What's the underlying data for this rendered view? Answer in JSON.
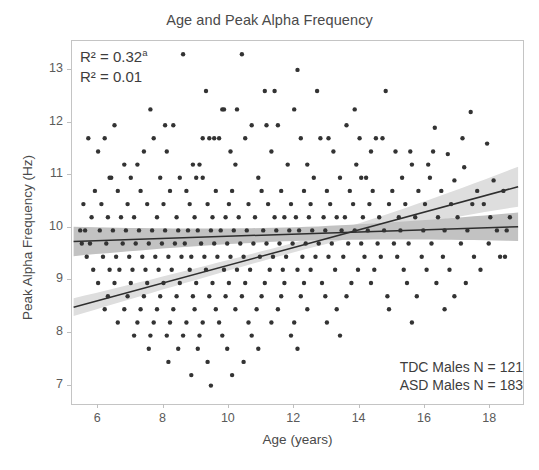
{
  "chart_data": {
    "type": "scatter",
    "title": "Age and Peak Alpha Frequency",
    "xlabel": "Age (years)",
    "ylabel": "Peak Alpha Frequency (Hz)",
    "xlim": [
      5.2,
      19.0
    ],
    "ylim": [
      6.65,
      13.55
    ],
    "xticks": [
      6,
      8,
      10,
      12,
      14,
      16,
      18
    ],
    "yticks": [
      7,
      8,
      9,
      10,
      11,
      12,
      13
    ],
    "grid": false,
    "legend_position": "bottom-right",
    "annotations": [
      {
        "name": "r2-tdc",
        "text": "R² = 0.32",
        "superscript": "a"
      },
      {
        "name": "r2-asd",
        "text": "R² = 0.01",
        "superscript": ""
      }
    ],
    "legend": [
      {
        "name": "tdc-males",
        "label": "TDC Males N = 121",
        "n": 121
      },
      {
        "name": "asd-males",
        "label": "ASD Males N = 183",
        "n": 183
      }
    ],
    "point_color": "#333333",
    "point_radius": 2.2,
    "series": [
      {
        "name": "TDC Males",
        "group": "TDC",
        "n": 121,
        "r_squared": 0.32,
        "fit": {
          "type": "linear",
          "x_start": 5.25,
          "x_end": 18.85,
          "y_start": 9.74,
          "y_end": 10.02,
          "band_color": "#c2c2c2",
          "line_color": "#2e2e2e",
          "band_half_width_start": 0.28,
          "band_half_width_mid": 0.13,
          "band_half_width_end": 0.27
        }
      },
      {
        "name": "ASD Males",
        "group": "ASD",
        "n": 183,
        "r_squared": 0.01,
        "fit": {
          "type": "linear",
          "x_start": 5.25,
          "x_end": 18.85,
          "y_start": 8.49,
          "y_end": 10.78,
          "band_color": "#dedede",
          "line_color": "#2e2e2e",
          "band_half_width_start": 0.17,
          "band_half_width_mid": 0.09,
          "band_half_width_end": 0.38
        }
      }
    ],
    "points": [
      [
        8.6,
        13.3
      ],
      [
        10.4,
        13.3
      ],
      [
        12.1,
        13.0
      ],
      [
        9.3,
        12.6
      ],
      [
        11.1,
        12.6
      ],
      [
        14.8,
        12.6
      ],
      [
        7.6,
        12.25
      ],
      [
        9.8,
        12.25
      ],
      [
        9.85,
        12.25
      ],
      [
        12.0,
        12.25
      ],
      [
        17.4,
        12.2
      ],
      [
        6.5,
        11.95
      ],
      [
        8.3,
        11.95
      ],
      [
        10.7,
        11.95
      ],
      [
        11.5,
        11.95
      ],
      [
        13.6,
        11.95
      ],
      [
        16.3,
        11.9
      ],
      [
        5.7,
        11.7
      ],
      [
        6.2,
        11.7
      ],
      [
        7.7,
        11.7
      ],
      [
        9.2,
        11.7
      ],
      [
        9.4,
        11.7
      ],
      [
        9.55,
        11.7
      ],
      [
        9.7,
        11.7
      ],
      [
        10.5,
        11.7
      ],
      [
        12.2,
        11.7
      ],
      [
        12.8,
        11.7
      ],
      [
        14.0,
        11.7
      ],
      [
        14.5,
        11.7
      ],
      [
        14.7,
        11.7
      ],
      [
        17.9,
        11.6
      ],
      [
        6.0,
        11.45
      ],
      [
        7.4,
        11.45
      ],
      [
        8.1,
        11.45
      ],
      [
        11.3,
        11.45
      ],
      [
        13.2,
        11.45
      ],
      [
        15.1,
        11.45
      ],
      [
        16.7,
        11.4
      ],
      [
        6.8,
        11.2
      ],
      [
        7.2,
        11.2
      ],
      [
        8.9,
        11.2
      ],
      [
        9.1,
        11.2
      ],
      [
        10.2,
        11.2
      ],
      [
        11.8,
        11.2
      ],
      [
        12.4,
        11.2
      ],
      [
        13.9,
        11.2
      ],
      [
        15.6,
        11.2
      ],
      [
        16.1,
        11.2
      ],
      [
        17.2,
        11.15
      ],
      [
        6.4,
        10.95
      ],
      [
        7.0,
        10.95
      ],
      [
        8.5,
        10.95
      ],
      [
        9.0,
        10.95
      ],
      [
        10.9,
        10.95
      ],
      [
        12.6,
        10.95
      ],
      [
        13.4,
        10.95
      ],
      [
        14.2,
        10.95
      ],
      [
        15.3,
        10.95
      ],
      [
        16.9,
        10.9
      ],
      [
        18.1,
        10.9
      ],
      [
        5.9,
        10.7
      ],
      [
        6.6,
        10.7
      ],
      [
        7.3,
        10.7
      ],
      [
        8.2,
        10.7
      ],
      [
        8.7,
        10.7
      ],
      [
        9.6,
        10.7
      ],
      [
        10.1,
        10.7
      ],
      [
        11.0,
        10.7
      ],
      [
        11.6,
        10.7
      ],
      [
        12.3,
        10.7
      ],
      [
        13.0,
        10.7
      ],
      [
        13.7,
        10.7
      ],
      [
        14.4,
        10.7
      ],
      [
        15.0,
        10.7
      ],
      [
        15.8,
        10.7
      ],
      [
        16.5,
        10.7
      ],
      [
        17.6,
        10.7
      ],
      [
        6.1,
        10.45
      ],
      [
        6.9,
        10.45
      ],
      [
        7.5,
        10.45
      ],
      [
        8.0,
        10.45
      ],
      [
        8.8,
        10.45
      ],
      [
        9.35,
        10.45
      ],
      [
        10.0,
        10.45
      ],
      [
        10.6,
        10.45
      ],
      [
        11.2,
        10.45
      ],
      [
        11.9,
        10.45
      ],
      [
        12.5,
        10.45
      ],
      [
        13.1,
        10.45
      ],
      [
        13.8,
        10.45
      ],
      [
        14.3,
        10.45
      ],
      [
        14.9,
        10.45
      ],
      [
        15.4,
        10.45
      ],
      [
        16.0,
        10.45
      ],
      [
        16.8,
        10.45
      ],
      [
        17.8,
        10.45
      ],
      [
        5.8,
        10.2
      ],
      [
        6.3,
        10.2
      ],
      [
        6.7,
        10.2
      ],
      [
        7.1,
        10.2
      ],
      [
        7.8,
        10.2
      ],
      [
        8.4,
        10.2
      ],
      [
        8.95,
        10.2
      ],
      [
        9.5,
        10.2
      ],
      [
        9.9,
        10.2
      ],
      [
        10.3,
        10.2
      ],
      [
        10.8,
        10.2
      ],
      [
        11.4,
        10.2
      ],
      [
        11.7,
        10.2
      ],
      [
        12.05,
        10.2
      ],
      [
        12.45,
        10.2
      ],
      [
        12.9,
        10.2
      ],
      [
        13.3,
        10.2
      ],
      [
        13.55,
        10.2
      ],
      [
        14.1,
        10.2
      ],
      [
        14.6,
        10.2
      ],
      [
        15.2,
        10.2
      ],
      [
        15.7,
        10.2
      ],
      [
        16.4,
        10.2
      ],
      [
        17.0,
        10.2
      ],
      [
        18.0,
        10.2
      ],
      [
        5.6,
        9.95
      ],
      [
        6.05,
        9.95
      ],
      [
        6.45,
        9.95
      ],
      [
        6.85,
        9.95
      ],
      [
        7.25,
        9.95
      ],
      [
        7.65,
        9.95
      ],
      [
        8.05,
        9.95
      ],
      [
        8.45,
        9.95
      ],
      [
        8.75,
        9.95
      ],
      [
        9.05,
        9.95
      ],
      [
        9.45,
        9.95
      ],
      [
        9.75,
        9.95
      ],
      [
        10.15,
        9.95
      ],
      [
        10.55,
        9.95
      ],
      [
        11.05,
        9.95
      ],
      [
        11.45,
        9.95
      ],
      [
        11.85,
        9.95
      ],
      [
        12.15,
        9.95
      ],
      [
        12.55,
        9.95
      ],
      [
        12.95,
        9.95
      ],
      [
        13.45,
        9.95
      ],
      [
        13.85,
        9.95
      ],
      [
        14.25,
        9.95
      ],
      [
        14.75,
        9.95
      ],
      [
        15.25,
        9.95
      ],
      [
        15.95,
        9.95
      ],
      [
        16.6,
        9.95
      ],
      [
        17.3,
        9.95
      ],
      [
        18.2,
        9.95
      ],
      [
        5.75,
        9.7
      ],
      [
        6.25,
        9.7
      ],
      [
        6.75,
        9.7
      ],
      [
        7.15,
        9.7
      ],
      [
        7.55,
        9.7
      ],
      [
        7.95,
        9.7
      ],
      [
        8.35,
        9.7
      ],
      [
        8.65,
        9.7
      ],
      [
        9.15,
        9.7
      ],
      [
        9.55,
        9.7
      ],
      [
        9.95,
        9.7
      ],
      [
        10.35,
        9.7
      ],
      [
        10.75,
        9.7
      ],
      [
        11.15,
        9.7
      ],
      [
        11.55,
        9.7
      ],
      [
        11.95,
        9.7
      ],
      [
        12.35,
        9.7
      ],
      [
        12.75,
        9.7
      ],
      [
        13.15,
        9.7
      ],
      [
        13.65,
        9.7
      ],
      [
        14.05,
        9.7
      ],
      [
        14.55,
        9.7
      ],
      [
        15.05,
        9.7
      ],
      [
        15.5,
        9.7
      ],
      [
        16.2,
        9.7
      ],
      [
        17.1,
        9.7
      ],
      [
        17.95,
        9.7
      ],
      [
        5.65,
        9.45
      ],
      [
        6.15,
        9.45
      ],
      [
        6.55,
        9.45
      ],
      [
        6.95,
        9.45
      ],
      [
        7.35,
        9.45
      ],
      [
        7.75,
        9.45
      ],
      [
        8.15,
        9.45
      ],
      [
        8.55,
        9.45
      ],
      [
        8.85,
        9.45
      ],
      [
        9.25,
        9.45
      ],
      [
        9.65,
        9.45
      ],
      [
        10.05,
        9.45
      ],
      [
        10.45,
        9.45
      ],
      [
        10.95,
        9.45
      ],
      [
        11.35,
        9.45
      ],
      [
        11.75,
        9.45
      ],
      [
        12.25,
        9.45
      ],
      [
        12.65,
        9.45
      ],
      [
        13.05,
        9.45
      ],
      [
        13.5,
        9.45
      ],
      [
        14.15,
        9.45
      ],
      [
        14.65,
        9.45
      ],
      [
        15.15,
        9.45
      ],
      [
        15.9,
        9.45
      ],
      [
        16.55,
        9.45
      ],
      [
        17.5,
        9.45
      ],
      [
        18.3,
        9.45
      ],
      [
        5.85,
        9.2
      ],
      [
        6.35,
        9.2
      ],
      [
        6.65,
        9.2
      ],
      [
        7.05,
        9.2
      ],
      [
        7.45,
        9.2
      ],
      [
        7.85,
        9.2
      ],
      [
        8.25,
        9.2
      ],
      [
        8.8,
        9.2
      ],
      [
        9.3,
        9.2
      ],
      [
        9.85,
        9.2
      ],
      [
        10.25,
        9.2
      ],
      [
        10.65,
        9.2
      ],
      [
        11.25,
        9.2
      ],
      [
        11.65,
        9.2
      ],
      [
        12.1,
        9.2
      ],
      [
        12.5,
        9.2
      ],
      [
        13.25,
        9.2
      ],
      [
        13.95,
        9.2
      ],
      [
        14.45,
        9.2
      ],
      [
        15.35,
        9.2
      ],
      [
        16.05,
        9.2
      ],
      [
        16.75,
        9.2
      ],
      [
        17.7,
        9.2
      ],
      [
        6.0,
        8.95
      ],
      [
        6.5,
        8.95
      ],
      [
        7.0,
        8.95
      ],
      [
        7.5,
        8.95
      ],
      [
        8.0,
        8.95
      ],
      [
        8.5,
        8.95
      ],
      [
        9.0,
        8.95
      ],
      [
        9.5,
        8.95
      ],
      [
        10.0,
        8.95
      ],
      [
        10.5,
        8.95
      ],
      [
        11.1,
        8.95
      ],
      [
        11.7,
        8.95
      ],
      [
        12.3,
        8.95
      ],
      [
        12.85,
        8.95
      ],
      [
        13.75,
        8.95
      ],
      [
        14.35,
        8.95
      ],
      [
        15.45,
        8.95
      ],
      [
        16.35,
        8.95
      ],
      [
        17.25,
        8.95
      ],
      [
        6.3,
        8.7
      ],
      [
        6.9,
        8.7
      ],
      [
        7.4,
        8.7
      ],
      [
        7.9,
        8.7
      ],
      [
        8.4,
        8.7
      ],
      [
        8.9,
        8.7
      ],
      [
        9.4,
        8.7
      ],
      [
        9.9,
        8.7
      ],
      [
        10.4,
        8.7
      ],
      [
        11.0,
        8.7
      ],
      [
        11.6,
        8.7
      ],
      [
        12.2,
        8.7
      ],
      [
        12.95,
        8.7
      ],
      [
        13.6,
        8.7
      ],
      [
        14.85,
        8.7
      ],
      [
        15.75,
        8.7
      ],
      [
        16.9,
        8.7
      ],
      [
        6.2,
        8.45
      ],
      [
        6.8,
        8.45
      ],
      [
        7.3,
        8.45
      ],
      [
        7.8,
        8.45
      ],
      [
        8.3,
        8.45
      ],
      [
        8.95,
        8.45
      ],
      [
        9.6,
        8.45
      ],
      [
        10.2,
        8.45
      ],
      [
        10.85,
        8.45
      ],
      [
        11.5,
        8.45
      ],
      [
        12.4,
        8.45
      ],
      [
        13.3,
        8.45
      ],
      [
        14.9,
        8.45
      ],
      [
        16.6,
        8.45
      ],
      [
        6.6,
        8.2
      ],
      [
        7.2,
        8.2
      ],
      [
        7.7,
        8.2
      ],
      [
        8.2,
        8.2
      ],
      [
        8.7,
        8.2
      ],
      [
        9.2,
        8.2
      ],
      [
        9.7,
        8.2
      ],
      [
        10.6,
        8.2
      ],
      [
        11.3,
        8.2
      ],
      [
        12.0,
        8.2
      ],
      [
        13.0,
        8.2
      ],
      [
        15.6,
        8.2
      ],
      [
        7.1,
        7.95
      ],
      [
        7.6,
        7.95
      ],
      [
        8.1,
        7.95
      ],
      [
        8.6,
        7.95
      ],
      [
        9.1,
        7.95
      ],
      [
        9.8,
        7.95
      ],
      [
        10.7,
        7.95
      ],
      [
        11.9,
        7.95
      ],
      [
        13.4,
        7.95
      ],
      [
        7.55,
        7.7
      ],
      [
        8.45,
        7.7
      ],
      [
        9.05,
        7.7
      ],
      [
        9.95,
        7.7
      ],
      [
        10.9,
        7.7
      ],
      [
        12.1,
        7.7
      ],
      [
        8.15,
        7.45
      ],
      [
        9.35,
        7.45
      ],
      [
        10.45,
        7.45
      ],
      [
        8.85,
        7.2
      ],
      [
        10.1,
        7.2
      ],
      [
        9.45,
        7.0
      ],
      [
        8.05,
        11.95
      ],
      [
        10.25,
        12.25
      ],
      [
        13.05,
        11.7
      ],
      [
        15.55,
        11.45
      ],
      [
        11.15,
        11.95
      ],
      [
        14.35,
        11.45
      ],
      [
        16.15,
        10.95
      ],
      [
        17.45,
        10.45
      ],
      [
        18.4,
        10.7
      ],
      [
        18.5,
        9.95
      ],
      [
        5.45,
        9.95
      ],
      [
        5.5,
        9.7
      ],
      [
        5.55,
        10.45
      ],
      [
        18.6,
        10.2
      ],
      [
        18.45,
        9.45
      ],
      [
        12.7,
        12.6
      ],
      [
        13.85,
        12.25
      ],
      [
        11.4,
        12.6
      ],
      [
        10.05,
        11.45
      ],
      [
        6.35,
        10.95
      ],
      [
        7.9,
        10.95
      ],
      [
        9.2,
        10.95
      ],
      [
        14.05,
        10.95
      ],
      [
        16.25,
        11.45
      ],
      [
        17.15,
        11.7
      ]
    ]
  }
}
